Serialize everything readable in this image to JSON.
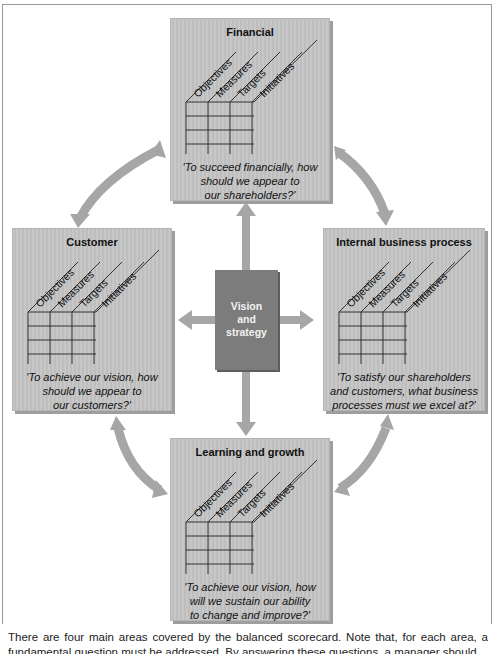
{
  "diagram": {
    "center": {
      "label_lines": [
        "Vision",
        "and",
        "strategy"
      ]
    },
    "column_headers": [
      "Objectives",
      "Measures",
      "Targets",
      "Initiatives"
    ],
    "perspectives": [
      {
        "id": "financial",
        "title": "Financial",
        "question_lines": [
          "'To succeed financially, how",
          "should we appear to",
          "our shareholders?'"
        ]
      },
      {
        "id": "customer",
        "title": "Customer",
        "question_lines": [
          "'To achieve our vision, how",
          "should we appear to",
          "our customers?'"
        ]
      },
      {
        "id": "internal",
        "title": "Internal business process",
        "question_lines": [
          "'To satisfy our shareholders",
          "and customers, what business",
          "processes must we excel at?'"
        ]
      },
      {
        "id": "learning",
        "title": "Learning and growth",
        "question_lines": [
          "'To achieve our vision, how",
          "will we sustain our ability",
          "to change and improve?'"
        ]
      }
    ],
    "colors": {
      "box_fill": "#c4c4c4",
      "center_fill": "#7c7c7c",
      "arrow": "#a6a6a6",
      "grid_line": "#222222"
    }
  },
  "caption": {
    "line1": "There are four main areas covered by the balanced scorecard. Note that, for each area, a",
    "line2": "fundamental question must be addressed. By answering these questions, a manager should be"
  }
}
